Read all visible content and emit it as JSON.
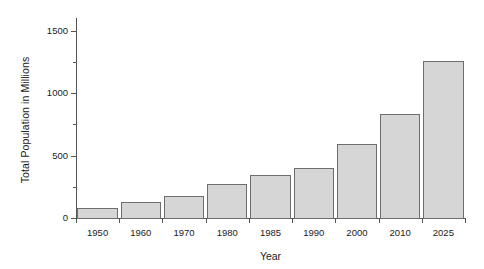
{
  "chart_data": {
    "type": "bar",
    "title": "",
    "xlabel": "Year",
    "ylabel": "Total Population in Millions",
    "categories": [
      "1950",
      "1960",
      "1970",
      "1980",
      "1985",
      "1990",
      "2000",
      "2010",
      "2025"
    ],
    "values": [
      80,
      130,
      180,
      270,
      345,
      400,
      590,
      830,
      1260
    ],
    "ylim": [
      0,
      1600
    ],
    "yticks": [
      0,
      500,
      1000,
      1500
    ],
    "ytick_labels": [
      "0",
      "500",
      "1000",
      "1500"
    ],
    "yticks_minor": [
      250,
      750,
      1250
    ],
    "grid": false,
    "legend": false,
    "bar_fill_color": "#d6d6d6",
    "bar_edge_color": "#6e6e6e",
    "axis_color": "#555555",
    "background_color": "#ffffff"
  }
}
